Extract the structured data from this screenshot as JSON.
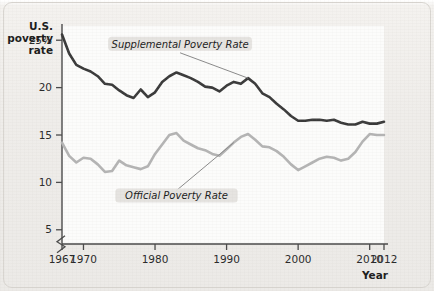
{
  "chart_data": {
    "type": "line",
    "title": "",
    "xlabel": "Year",
    "ylabel": "U.S. poverty rate",
    "ylabel_lines": [
      "U.S.",
      "poverty",
      "rate"
    ],
    "xlim": [
      1967,
      2012
    ],
    "ylim": [
      3.5,
      26.5
    ],
    "y_axis_break": true,
    "grid": false,
    "legend_position": "inline-annotation",
    "ytick_labels": [
      "25%",
      "20",
      "15",
      "10",
      "5"
    ],
    "ytick_values": [
      25,
      20,
      15,
      10,
      5
    ],
    "xtick_labels": [
      "1967",
      "1970",
      "1980",
      "1990",
      "2000",
      "2010",
      "2012"
    ],
    "xtick_values": [
      1967,
      1970,
      1980,
      1990,
      2000,
      2010,
      2012
    ],
    "x": [
      1967,
      1968,
      1969,
      1970,
      1971,
      1972,
      1973,
      1974,
      1975,
      1976,
      1977,
      1978,
      1979,
      1980,
      1981,
      1982,
      1983,
      1984,
      1985,
      1986,
      1987,
      1988,
      1989,
      1990,
      1991,
      1992,
      1993,
      1994,
      1995,
      1996,
      1997,
      1998,
      1999,
      2000,
      2001,
      2002,
      2003,
      2004,
      2005,
      2006,
      2007,
      2008,
      2009,
      2010,
      2011,
      2012
    ],
    "series": [
      {
        "name": "Supplemental Poverty Rate",
        "color": "#3a3a3a",
        "label_x": 1983.5,
        "label_y": 24.2,
        "values": [
          25.6,
          23.6,
          22.4,
          22.0,
          21.7,
          21.2,
          20.4,
          20.3,
          19.7,
          19.2,
          18.9,
          19.8,
          19.0,
          19.5,
          20.6,
          21.2,
          21.6,
          21.3,
          21.0,
          20.6,
          20.1,
          20.0,
          19.6,
          20.2,
          20.6,
          20.4,
          21.0,
          20.4,
          19.4,
          19.0,
          18.3,
          17.7,
          17.0,
          16.5,
          16.5,
          16.6,
          16.6,
          16.5,
          16.6,
          16.3,
          16.1,
          16.1,
          16.4,
          16.2,
          16.2,
          16.4
        ]
      },
      {
        "name": "Official Poverty Rate",
        "color": "#b4b4b4",
        "label_x": 1983.0,
        "label_y": 8.2,
        "values": [
          14.2,
          12.8,
          12.1,
          12.6,
          12.5,
          11.9,
          11.1,
          11.2,
          12.3,
          11.8,
          11.6,
          11.4,
          11.7,
          13.0,
          14.0,
          15.0,
          15.2,
          14.4,
          14.0,
          13.6,
          13.4,
          13.0,
          12.8,
          13.5,
          14.2,
          14.8,
          15.1,
          14.5,
          13.8,
          13.7,
          13.3,
          12.7,
          11.9,
          11.3,
          11.7,
          12.1,
          12.5,
          12.7,
          12.6,
          12.3,
          12.5,
          13.2,
          14.3,
          15.1,
          15.0,
          15.0
        ]
      }
    ]
  },
  "axis": {
    "y_title_line1": "U.S.",
    "y_title_line2": "poverty",
    "y_title_line3": "rate",
    "x_title": "Year"
  }
}
